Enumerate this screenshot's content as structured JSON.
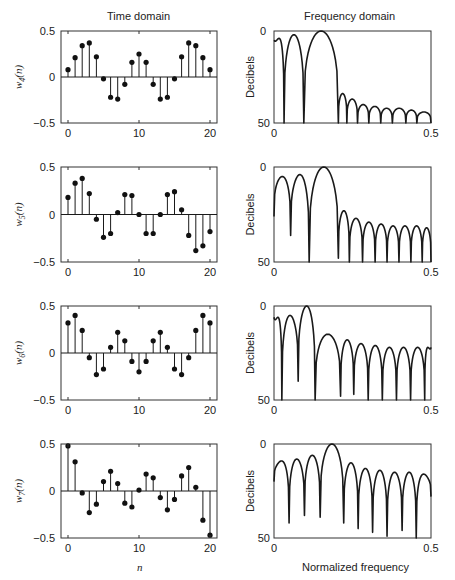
{
  "titles": {
    "time": "Time domain",
    "frequency": "Frequency domain"
  },
  "xlabels": {
    "time": "n",
    "frequency": "Normalized frequency"
  },
  "chart_data": [
    {
      "type": "stem",
      "id": "w4",
      "ylabel": "w4(n)",
      "ylabel_base": "w",
      "ylabel_sub": "4",
      "xlim": [
        0,
        20
      ],
      "ylim": [
        -0.5,
        0.5
      ],
      "xticks": [
        0,
        10,
        20
      ],
      "yticks": [
        0.5,
        0,
        -0.5
      ],
      "ytick_labels": [
        "0.5",
        "0",
        "−0.5"
      ],
      "x": [
        0,
        1,
        2,
        3,
        4,
        5,
        6,
        7,
        8,
        9,
        10,
        11,
        12,
        13,
        14,
        15,
        16,
        17,
        18,
        19,
        20
      ],
      "values": [
        0.08,
        0.21,
        0.34,
        0.37,
        0.22,
        -0.02,
        -0.22,
        -0.24,
        -0.08,
        0.16,
        0.25,
        0.16,
        -0.08,
        -0.24,
        -0.22,
        -0.02,
        0.22,
        0.37,
        0.34,
        0.21,
        0.08
      ]
    },
    {
      "type": "line",
      "id": "W4",
      "ylabel": "Decibels",
      "xlim": [
        0,
        0.5
      ],
      "ylim": [
        0,
        50
      ],
      "xtick_labels": [
        "0",
        "0.5"
      ],
      "ytick_labels": [
        "0",
        "50"
      ],
      "nulls": [
        0.0,
        0.032,
        0.095,
        0.205,
        0.232,
        0.266,
        0.302,
        0.34,
        0.377,
        0.42,
        0.455,
        0.5
      ],
      "null_depth_db": [
        5,
        50,
        50,
        50,
        50,
        50,
        50,
        50,
        50,
        50,
        50,
        50
      ],
      "peaks_db": [
        4,
        2,
        0,
        34,
        37,
        40,
        41,
        42,
        42,
        43,
        44
      ]
    },
    {
      "type": "stem",
      "id": "w5",
      "ylabel": "w5(n)",
      "ylabel_base": "w",
      "ylabel_sub": "5",
      "xlim": [
        0,
        20
      ],
      "ylim": [
        -0.5,
        0.5
      ],
      "xticks": [
        0,
        10,
        20
      ],
      "yticks": [
        0.5,
        0,
        -0.5
      ],
      "ytick_labels": [
        "0.5",
        "0",
        "−0.5"
      ],
      "x": [
        0,
        1,
        2,
        3,
        4,
        5,
        6,
        7,
        8,
        9,
        10,
        11,
        12,
        13,
        14,
        15,
        16,
        17,
        18,
        19,
        20
      ],
      "values": [
        0.18,
        0.33,
        0.38,
        0.22,
        -0.05,
        -0.24,
        -0.2,
        0.02,
        0.21,
        0.2,
        0.0,
        -0.2,
        -0.2,
        0.0,
        0.21,
        0.24,
        0.05,
        -0.22,
        -0.38,
        -0.33,
        -0.18
      ]
    },
    {
      "type": "line",
      "id": "W5",
      "ylabel": "Decibels",
      "xlim": [
        0,
        0.5
      ],
      "ylim": [
        0,
        50
      ],
      "xtick_labels": [
        "0",
        "0.5"
      ],
      "ytick_labels": [
        "0",
        "50"
      ],
      "nulls": [
        0.0,
        0.053,
        0.112,
        0.205,
        0.24,
        0.282,
        0.322,
        0.36,
        0.398,
        0.436,
        0.472,
        0.5
      ],
      "null_depth_db": [
        26,
        36,
        50,
        48,
        50,
        50,
        50,
        50,
        50,
        50,
        50,
        50
      ],
      "peaks_db": [
        5,
        4,
        0,
        23,
        27,
        29,
        30,
        31,
        31,
        31,
        32
      ]
    },
    {
      "type": "stem",
      "id": "w6",
      "ylabel": "w6(n)",
      "ylabel_base": "w",
      "ylabel_sub": "6",
      "xlim": [
        0,
        20
      ],
      "ylim": [
        -0.5,
        0.5
      ],
      "xticks": [
        0,
        10,
        20
      ],
      "yticks": [
        0.5,
        0,
        -0.5
      ],
      "ytick_labels": [
        "0.5",
        "0",
        "−0.5"
      ],
      "x": [
        0,
        1,
        2,
        3,
        4,
        5,
        6,
        7,
        8,
        9,
        10,
        11,
        12,
        13,
        14,
        15,
        16,
        17,
        18,
        19,
        20
      ],
      "values": [
        0.32,
        0.4,
        0.24,
        -0.05,
        -0.23,
        -0.17,
        0.06,
        0.22,
        0.13,
        -0.09,
        -0.2,
        -0.09,
        0.13,
        0.22,
        0.06,
        -0.17,
        -0.23,
        -0.05,
        0.24,
        0.4,
        0.32
      ]
    },
    {
      "type": "line",
      "id": "W6",
      "ylabel": "Decibels",
      "xlim": [
        0,
        0.5
      ],
      "ylim": [
        0,
        50
      ],
      "xtick_labels": [
        "0",
        "0.5"
      ],
      "ytick_labels": [
        "0",
        "50"
      ],
      "nulls": [
        0.0,
        0.025,
        0.077,
        0.131,
        0.212,
        0.254,
        0.3,
        0.345,
        0.39,
        0.435,
        0.48,
        0.5
      ],
      "null_depth_db": [
        6,
        50,
        40,
        50,
        48,
        47,
        50,
        50,
        50,
        50,
        50,
        22
      ],
      "peaks_db": [
        6,
        5,
        0,
        15,
        18,
        20,
        21,
        22,
        22,
        22,
        22
      ]
    },
    {
      "type": "stem",
      "id": "w7",
      "ylabel": "w7(n)",
      "ylabel_base": "w",
      "ylabel_sub": "7",
      "xlim": [
        0,
        20
      ],
      "ylim": [
        -0.5,
        0.5
      ],
      "xticks": [
        0,
        10,
        20
      ],
      "yticks": [
        0.5,
        0,
        -0.5
      ],
      "ytick_labels": [
        "0.5",
        "0",
        "−0.5"
      ],
      "x": [
        0,
        1,
        2,
        3,
        4,
        5,
        6,
        7,
        8,
        9,
        10,
        11,
        12,
        13,
        14,
        15,
        16,
        17,
        18,
        19,
        20
      ],
      "values": [
        0.48,
        0.31,
        -0.02,
        -0.23,
        -0.14,
        0.1,
        0.21,
        0.08,
        -0.13,
        -0.17,
        0.01,
        0.18,
        0.14,
        -0.07,
        -0.2,
        -0.09,
        0.16,
        0.25,
        0.04,
        -0.31,
        -0.47
      ]
    },
    {
      "type": "line",
      "id": "W7",
      "ylabel": "Decibels",
      "xlim": [
        0,
        0.5
      ],
      "ylim": [
        0,
        50
      ],
      "xtick_labels": [
        "0",
        "0.5"
      ],
      "ytick_labels": [
        "0",
        "50"
      ],
      "nulls": [
        0.0,
        0.048,
        0.097,
        0.147,
        0.222,
        0.268,
        0.314,
        0.36,
        0.408,
        0.453,
        0.5
      ],
      "null_depth_db": [
        20,
        42,
        38,
        39,
        42,
        45,
        47,
        49,
        46,
        50,
        28
      ],
      "peaks_db": [
        9,
        8,
        6,
        0,
        10,
        13,
        14,
        15,
        15,
        16
      ]
    }
  ],
  "layout": {
    "rows": [
      {
        "top": 31,
        "bottom": 123
      },
      {
        "top": 167,
        "bottom": 262
      },
      {
        "top": 306,
        "bottom": 400
      },
      {
        "top": 444,
        "bottom": 538
      }
    ],
    "time": {
      "left": 61,
      "right": 217
    },
    "freq": {
      "left": 274,
      "right": 431
    }
  }
}
